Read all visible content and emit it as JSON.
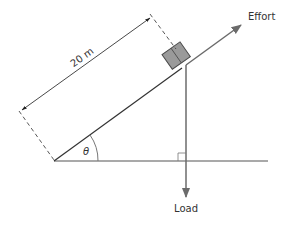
{
  "diagram": {
    "labels": {
      "effort": "Effort",
      "load": "Load",
      "length": "20 m",
      "angle": "θ"
    },
    "colors": {
      "line": "#3a3a3a",
      "arrow": "#6b6b6b",
      "box_fill": "#9a9a9a",
      "box_stroke": "#4a4a4a",
      "text": "#333333"
    }
  }
}
